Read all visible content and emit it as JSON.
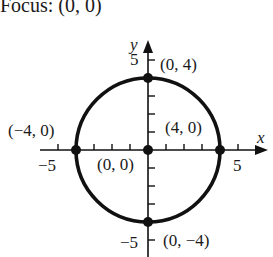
{
  "title": "Focus: (0, 0)",
  "diagram": {
    "type": "circle-graph",
    "equation_center": [
      0,
      0
    ],
    "radius": 4,
    "axes": {
      "x_label": "x",
      "y_label": "y",
      "x_ticks": [
        "−5",
        "5"
      ],
      "y_ticks": [
        "5",
        "−5"
      ]
    },
    "points": [
      {
        "label": "(0, 4)",
        "x": 0,
        "y": 4
      },
      {
        "label": "(−4, 0)",
        "x": -4,
        "y": 0
      },
      {
        "label": "(4, 0)",
        "x": 4,
        "y": 0
      },
      {
        "label": "(0, 0)",
        "x": 0,
        "y": 0
      },
      {
        "label": "(0, −4)",
        "x": 0,
        "y": -4
      }
    ],
    "colors": {
      "stroke": "#111111",
      "background": "#ffffff"
    }
  }
}
